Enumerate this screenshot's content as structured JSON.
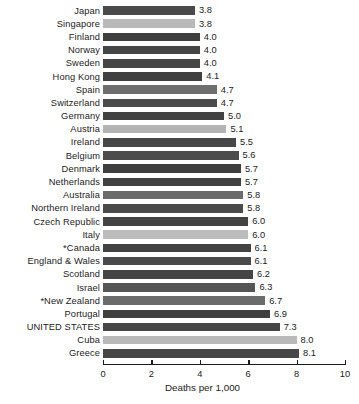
{
  "chart_data": {
    "type": "bar",
    "orientation": "horizontal",
    "title": "",
    "xlabel": "Deaths per 1,000",
    "ylabel": "",
    "xlim": [
      0,
      10
    ],
    "xticks": [
      0,
      2,
      4,
      6,
      8,
      10
    ],
    "xticklabels": [
      "0",
      "2",
      "4",
      "6",
      "8",
      "10"
    ],
    "grid": false,
    "legend": null,
    "categories": [
      "Japan",
      "Singapore",
      "Finland",
      "Norway",
      "Sweden",
      "Hong Kong",
      "Spain",
      "Switzerland",
      "Germany",
      "Austria",
      "Ireland",
      "Belgium",
      "Denmark",
      "Netherlands",
      "Australia",
      "Northern Ireland",
      "Czech Republic",
      "Italy",
      "*Canada",
      "England & Wales",
      "Scotland",
      "Israel",
      "*New Zealand",
      "Portugal",
      "UNITED STATES",
      "Cuba",
      "Greece"
    ],
    "values": [
      3.8,
      3.8,
      4.0,
      4.0,
      4.0,
      4.1,
      4.7,
      4.7,
      5.0,
      5.1,
      5.5,
      5.6,
      5.7,
      5.7,
      5.8,
      5.8,
      6.0,
      6.0,
      6.1,
      6.1,
      6.2,
      6.3,
      6.7,
      6.9,
      7.3,
      8.0,
      8.1
    ],
    "value_labels": [
      "3.8",
      "3.8",
      "4.0",
      "4.0",
      "4.0",
      "4.1",
      "4.7",
      "4.7",
      "5.0",
      "5.1",
      "5.5",
      "5.6",
      "5.7",
      "5.7",
      "5.8",
      "5.8",
      "6.0",
      "6.0",
      "6.1",
      "6.1",
      "6.2",
      "6.3",
      "6.7",
      "6.9",
      "7.3",
      "8.0",
      "8.1"
    ],
    "bar_colors": [
      "#4a4a4a",
      "#b9b9b9",
      "#3f3f3f",
      "#454545",
      "#454545",
      "#404040",
      "#6e6e6e",
      "#4a4a4a",
      "#414141",
      "#b3b3b3",
      "#474747",
      "#4c4c4c",
      "#3f3f3f",
      "#414141",
      "#6b6b6b",
      "#4a4a4a",
      "#434343",
      "#bcbcbc",
      "#434343",
      "#4a4a4a",
      "#454545",
      "#555555",
      "#6b6b6b",
      "#3f3f3f",
      "#474747",
      "#b9b9b9",
      "#474747"
    ],
    "rows": [
      {
        "label": "Japan",
        "value": 3.8,
        "value_label": "3.8",
        "color": "#4a4a4a"
      },
      {
        "label": "Singapore",
        "value": 3.8,
        "value_label": "3.8",
        "color": "#b9b9b9"
      },
      {
        "label": "Finland",
        "value": 4.0,
        "value_label": "4.0",
        "color": "#3f3f3f"
      },
      {
        "label": "Norway",
        "value": 4.0,
        "value_label": "4.0",
        "color": "#454545"
      },
      {
        "label": "Sweden",
        "value": 4.0,
        "value_label": "4.0",
        "color": "#454545"
      },
      {
        "label": "Hong Kong",
        "value": 4.1,
        "value_label": "4.1",
        "color": "#404040"
      },
      {
        "label": "Spain",
        "value": 4.7,
        "value_label": "4.7",
        "color": "#6e6e6e"
      },
      {
        "label": "Switzerland",
        "value": 4.7,
        "value_label": "4.7",
        "color": "#4a4a4a"
      },
      {
        "label": "Germany",
        "value": 5.0,
        "value_label": "5.0",
        "color": "#414141"
      },
      {
        "label": "Austria",
        "value": 5.1,
        "value_label": "5.1",
        "color": "#b3b3b3"
      },
      {
        "label": "Ireland",
        "value": 5.5,
        "value_label": "5.5",
        "color": "#474747"
      },
      {
        "label": "Belgium",
        "value": 5.6,
        "value_label": "5.6",
        "color": "#4c4c4c"
      },
      {
        "label": "Denmark",
        "value": 5.7,
        "value_label": "5.7",
        "color": "#3f3f3f"
      },
      {
        "label": "Netherlands",
        "value": 5.7,
        "value_label": "5.7",
        "color": "#414141"
      },
      {
        "label": "Australia",
        "value": 5.8,
        "value_label": "5.8",
        "color": "#6b6b6b"
      },
      {
        "label": "Northern Ireland",
        "value": 5.8,
        "value_label": "5.8",
        "color": "#4a4a4a"
      },
      {
        "label": "Czech Republic",
        "value": 6.0,
        "value_label": "6.0",
        "color": "#434343"
      },
      {
        "label": "Italy",
        "value": 6.0,
        "value_label": "6.0",
        "color": "#bcbcbc"
      },
      {
        "label": "*Canada",
        "value": 6.1,
        "value_label": "6.1",
        "color": "#434343"
      },
      {
        "label": "England & Wales",
        "value": 6.1,
        "value_label": "6.1",
        "color": "#4a4a4a"
      },
      {
        "label": "Scotland",
        "value": 6.2,
        "value_label": "6.2",
        "color": "#454545"
      },
      {
        "label": "Israel",
        "value": 6.3,
        "value_label": "6.3",
        "color": "#555555"
      },
      {
        "label": "*New Zealand",
        "value": 6.7,
        "value_label": "6.7",
        "color": "#6b6b6b"
      },
      {
        "label": "Portugal",
        "value": 6.9,
        "value_label": "6.9",
        "color": "#3f3f3f"
      },
      {
        "label": "UNITED STATES",
        "value": 7.3,
        "value_label": "7.3",
        "color": "#474747"
      },
      {
        "label": "Cuba",
        "value": 8.0,
        "value_label": "8.0",
        "color": "#b9b9b9"
      },
      {
        "label": "Greece",
        "value": 8.1,
        "value_label": "8.1",
        "color": "#474747"
      }
    ]
  }
}
